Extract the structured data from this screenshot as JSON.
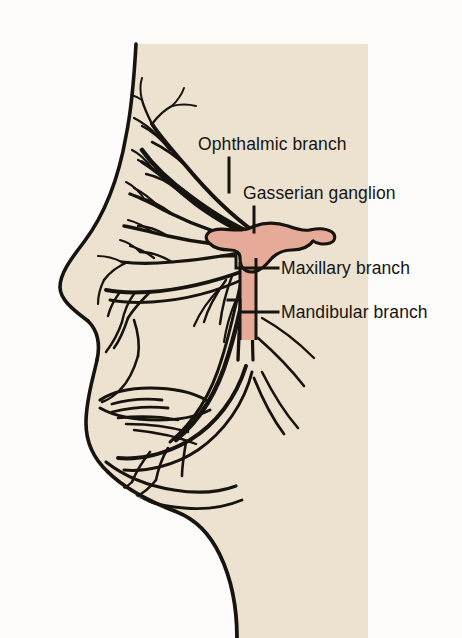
{
  "figure": {
    "kind": "anatomical-illustration",
    "panel": {
      "background_color": "#efe9dc",
      "page_color": "#fdfcfa"
    },
    "colors": {
      "skin_fill": "#ece2cf",
      "ganglion_pink": "#e5ab98",
      "nerve_ink": "#17140f",
      "outline": "#17140f",
      "label_text": "#141414",
      "bleed_through": "#cfc8bd"
    }
  },
  "labels": {
    "ophthalmic": "Ophthalmic branch",
    "gasserian": "Gasserian ganglion",
    "maxillary": "Maxillary branch",
    "mandibular": "Mandibular branch"
  },
  "bleed_through_text": {
    "line1": "arity and",
    "line2": "distinct",
    "line3": "nerve of",
    "line4": "sensory",
    "line5": "branch",
    "line6": "region",
    "line7": "fibres",
    "line8": "motor"
  }
}
